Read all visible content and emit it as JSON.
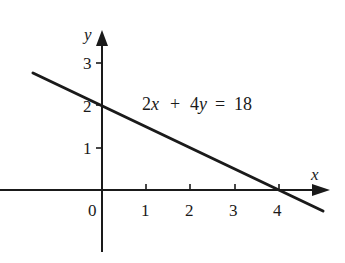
{
  "chart_data": {
    "type": "line",
    "title": "",
    "xlabel": "x",
    "ylabel": "y",
    "xlim": [
      -2.3,
      5.1
    ],
    "ylim": [
      -1.4,
      3.6
    ],
    "grid": false,
    "legend": null,
    "x_ticks": [
      1,
      2,
      3,
      4
    ],
    "y_ticks": [
      1,
      2,
      3
    ],
    "origin_label": "0",
    "series": [
      {
        "name": "2x + 4y = 18",
        "x": [
          -1.55,
          0,
          4,
          4.95
        ],
        "y": [
          2.75,
          2,
          0,
          -0.48
        ],
        "x_intercept": 4,
        "y_intercept": 2
      }
    ],
    "annotations": [
      {
        "text": "2x + 4y = 18",
        "x": 1.0,
        "y": 2.0
      }
    ]
  },
  "labels": {
    "x_axis": "x",
    "y_axis": "y",
    "origin": "0",
    "x_tick_1": "1",
    "x_tick_2": "2",
    "x_tick_3": "3",
    "x_tick_4": "4",
    "y_tick_1": "1",
    "y_tick_2": "2",
    "y_tick_3": "3",
    "equation_2x": "2x",
    "equation_plus": "+",
    "equation_4y": "4y",
    "equation_eq": "=",
    "equation_rhs": "18"
  },
  "colors": {
    "ink": "#1a1a1a",
    "background": "#ffffff"
  }
}
